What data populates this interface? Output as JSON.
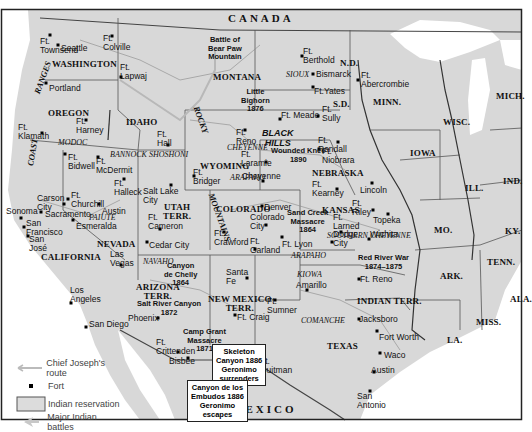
{
  "map": {
    "background_land": "#d9d9d9",
    "water": "#ffffff",
    "border_color": "#333333",
    "countries": {
      "north": "CANADA",
      "south": "MEXICO"
    },
    "states": [
      {
        "id": "washington",
        "label": "WASHINGTON",
        "x": 52,
        "y": 60
      },
      {
        "id": "oregon",
        "label": "OREGON",
        "x": 48,
        "y": 109
      },
      {
        "id": "idaho",
        "label": "IDAHO",
        "x": 126,
        "y": 118
      },
      {
        "id": "montana",
        "label": "MONTANA",
        "x": 213,
        "y": 73
      },
      {
        "id": "wyoming",
        "label": "WYOMING",
        "x": 200,
        "y": 162
      },
      {
        "id": "nd",
        "label": "N.D.",
        "x": 340,
        "y": 59
      },
      {
        "id": "sd",
        "label": "S.D.",
        "x": 333,
        "y": 100
      },
      {
        "id": "nebraska",
        "label": "NEBRASKA",
        "x": 312,
        "y": 169
      },
      {
        "id": "kansas",
        "label": "KANSAS",
        "x": 322,
        "y": 206
      },
      {
        "id": "colorado",
        "label": "COLORADO",
        "x": 216,
        "y": 205
      },
      {
        "id": "utah",
        "label": "UTAH\nTERR.",
        "x": 163,
        "y": 203
      },
      {
        "id": "nevada",
        "label": "NEVADA",
        "x": 97,
        "y": 240
      },
      {
        "id": "california",
        "label": "CALIFORNIA",
        "x": 41,
        "y": 253
      },
      {
        "id": "arizona",
        "label": "ARIZONA\nTERR.",
        "x": 136,
        "y": 283
      },
      {
        "id": "new-mexico",
        "label": "NEW MEXICO\nTERR.",
        "x": 208,
        "y": 295
      },
      {
        "id": "texas",
        "label": "TEXAS",
        "x": 327,
        "y": 342
      },
      {
        "id": "indian-terr",
        "label": "INDIAN TERR.",
        "x": 357,
        "y": 297
      },
      {
        "id": "minn",
        "label": "MINN.",
        "x": 373,
        "y": 98
      },
      {
        "id": "wisc",
        "label": "WISC.",
        "x": 443,
        "y": 118
      },
      {
        "id": "mich",
        "label": "MICH.",
        "x": 496,
        "y": 92
      },
      {
        "id": "iowa",
        "label": "IOWA",
        "x": 410,
        "y": 149
      },
      {
        "id": "ill",
        "label": "ILL.",
        "x": 465,
        "y": 184
      },
      {
        "id": "ind",
        "label": "IND.",
        "x": 503,
        "y": 177
      },
      {
        "id": "mo",
        "label": "MO.",
        "x": 434,
        "y": 226
      },
      {
        "id": "ky",
        "label": "KY.",
        "x": 505,
        "y": 227
      },
      {
        "id": "tenn",
        "label": "TENN.",
        "x": 487,
        "y": 258
      },
      {
        "id": "ark",
        "label": "ARK.",
        "x": 440,
        "y": 272
      },
      {
        "id": "miss",
        "label": "MISS.",
        "x": 476,
        "y": 318
      },
      {
        "id": "ala",
        "label": "ALA.",
        "x": 510,
        "y": 295
      },
      {
        "id": "la",
        "label": "LA.",
        "x": 447,
        "y": 336
      }
    ],
    "tribes": [
      {
        "label": "MODOC",
        "x": 58,
        "y": 138
      },
      {
        "label": "BANNOCK",
        "x": 110,
        "y": 150
      },
      {
        "label": "SHOSHONI",
        "x": 149,
        "y": 150
      },
      {
        "label": "SIOUX",
        "x": 286,
        "y": 70
      },
      {
        "label": "CHEYENNE",
        "x": 227,
        "y": 143
      },
      {
        "label": "ARAPAHO",
        "x": 230,
        "y": 173
      },
      {
        "label": "PAIUTE",
        "x": 89,
        "y": 213
      },
      {
        "label": "NAVAHO",
        "x": 143,
        "y": 257
      },
      {
        "label": "ARAPAHO",
        "x": 291,
        "y": 251
      },
      {
        "label": "SOUTHERN CHEYENNE",
        "x": 327,
        "y": 231
      },
      {
        "label": "KIOWA",
        "x": 297,
        "y": 270
      },
      {
        "label": "COMANCHE",
        "x": 301,
        "y": 316
      }
    ],
    "ranges": [
      {
        "label": "COAST",
        "x": 26,
        "y": 165,
        "rotate": -80
      },
      {
        "label": "RANGES",
        "x": 33,
        "y": 92,
        "rotate": -70
      },
      {
        "label": "ROCKY",
        "x": 200,
        "y": 105,
        "rotate": 70
      },
      {
        "label": "MOUNTAINS",
        "x": 215,
        "y": 192,
        "rotate": 70
      }
    ],
    "places": [
      {
        "label": "Ft.\nTownsend",
        "x": 40,
        "y": 37,
        "dot": [
          50,
          35
        ]
      },
      {
        "label": "Seattle",
        "x": 61,
        "y": 44,
        "dot": [
          58,
          45
        ]
      },
      {
        "label": "Ft.\nColville",
        "x": 103,
        "y": 34,
        "dot": [
          112,
          36
        ]
      },
      {
        "label": "Ft.\nLapwaj",
        "x": 120,
        "y": 63,
        "dot": [
          121,
          77
        ]
      },
      {
        "label": "Portland",
        "x": 49,
        "y": 84,
        "dot": [
          46,
          83
        ]
      },
      {
        "label": "Ft.\nKlamath",
        "x": 18,
        "y": 123,
        "dot": [
          42,
          133
        ]
      },
      {
        "label": "Ft.\nHarney",
        "x": 76,
        "y": 117,
        "dot": [
          86,
          120
        ]
      },
      {
        "label": "Ft.\nHall",
        "x": 157,
        "y": 130,
        "dot": [
          168,
          145
        ]
      },
      {
        "label": "Ft.\nBidwell",
        "x": 68,
        "y": 153,
        "dot": [
          65,
          154
        ]
      },
      {
        "label": "Ft.\nMcDermit",
        "x": 96,
        "y": 157,
        "dot": [
          98,
          157
        ]
      },
      {
        "label": "Ft.\nHalleck",
        "x": 114,
        "y": 179,
        "dot": [
          124,
          179
        ]
      },
      {
        "label": "Salt Lake\nCity",
        "x": 143,
        "y": 187,
        "dot": [
          171,
          185
        ]
      },
      {
        "label": "Carson\nCity",
        "x": 37,
        "y": 194,
        "dot": [
          64,
          204
        ]
      },
      {
        "label": "Ft.\nChurchill",
        "x": 71,
        "y": 191,
        "dot": [
          68,
          199
        ]
      },
      {
        "label": "Austin",
        "x": 102,
        "y": 207,
        "dot": [
          99,
          204
        ]
      },
      {
        "label": "Sonoma",
        "x": 6,
        "y": 207,
        "dot": [
          21,
          218
        ]
      },
      {
        "label": "Sacramento",
        "x": 45,
        "y": 210,
        "dot": [
          41,
          212
        ]
      },
      {
        "label": "Esmeralda",
        "x": 76,
        "y": 222,
        "dot": [
          73,
          220
        ]
      },
      {
        "label": "San\nFrancisco",
        "x": 26,
        "y": 219,
        "dot": [
          24,
          227
        ]
      },
      {
        "label": "San\nJosé",
        "x": 29,
        "y": 235,
        "dot": [
          28,
          236
        ]
      },
      {
        "label": "Ft.\nCameron",
        "x": 148,
        "y": 213,
        "dot": [
          160,
          229
        ]
      },
      {
        "label": "Cedar City",
        "x": 149,
        "y": 241,
        "dot": [
          147,
          242
        ]
      },
      {
        "label": "Las\nVegas",
        "x": 110,
        "y": 250,
        "dot": [
          121,
          265
        ]
      },
      {
        "label": "Los\nAngeles",
        "x": 70,
        "y": 286,
        "dot": [
          71,
          303
        ]
      },
      {
        "label": "San Diego",
        "x": 89,
        "y": 320,
        "dot": [
          86,
          327
        ]
      },
      {
        "label": "Phoenix",
        "x": 128,
        "y": 314,
        "dot": [
          158,
          318
        ]
      },
      {
        "label": "Ft.\nCrittenden",
        "x": 156,
        "y": 338,
        "dot": [
          178,
          352
        ]
      },
      {
        "label": "Bisbee",
        "x": 169,
        "y": 357,
        "dot": [
          188,
          358
        ]
      },
      {
        "label": "Ft.\nBerthold",
        "x": 303,
        "y": 47,
        "dot": [
          302,
          56
        ]
      },
      {
        "label": "Bismarck",
        "x": 316,
        "y": 70,
        "dot": [
          313,
          74
        ]
      },
      {
        "label": "Ft.Yates",
        "x": 314,
        "y": 87,
        "dot": [
          313,
          87
        ]
      },
      {
        "label": "Ft.\nAbercrombie",
        "x": 361,
        "y": 71,
        "dot": [
          358,
          80
        ]
      },
      {
        "label": "Ft. Meade",
        "x": 281,
        "y": 111,
        "dot": [
          280,
          119
        ]
      },
      {
        "label": "Ft.\nSully",
        "x": 322,
        "y": 105,
        "dot": [
          318,
          116
        ]
      },
      {
        "label": "Ft.\nRandall",
        "x": 318,
        "y": 136,
        "dot": [
          338,
          142
        ]
      },
      {
        "label": "Ft.\nReno",
        "x": 236,
        "y": 128,
        "dot": [
          245,
          130
        ]
      },
      {
        "label": "Ft.\nNiobrara",
        "x": 322,
        "y": 147,
        "dot": [
          319,
          149
        ]
      },
      {
        "label": "Ft.\nLaramie",
        "x": 241,
        "y": 150,
        "dot": [
          266,
          162
        ]
      },
      {
        "label": "Cheyenne",
        "x": 242,
        "y": 172,
        "dot": [
          263,
          181
        ]
      },
      {
        "label": "Ft.\nBridger",
        "x": 193,
        "y": 168,
        "dot": [
          194,
          176
        ]
      },
      {
        "label": "Ft.\nKearney",
        "x": 312,
        "y": 180,
        "dot": [
          337,
          189
        ]
      },
      {
        "label": "Lincoln",
        "x": 360,
        "y": 186,
        "dot": [
          372,
          183
        ]
      },
      {
        "label": "Ft.\nRiley",
        "x": 352,
        "y": 199,
        "dot": [
          373,
          210
        ]
      },
      {
        "label": "Topeka",
        "x": 373,
        "y": 216,
        "dot": [
          388,
          214
        ]
      },
      {
        "label": "Denver",
        "x": 264,
        "y": 203,
        "dot": [
          262,
          206
        ]
      },
      {
        "label": "Colorado\nCity",
        "x": 250,
        "y": 213,
        "dot": [
          266,
          225
        ]
      },
      {
        "label": "Ft.\nCrawford",
        "x": 214,
        "y": 229,
        "dot": [
          224,
          232
        ]
      },
      {
        "label": "Ft.\nGarland",
        "x": 250,
        "y": 237,
        "dot": [
          255,
          249
        ]
      },
      {
        "label": "Ft. Lyon",
        "x": 282,
        "y": 240,
        "dot": [
          282,
          237
        ]
      },
      {
        "label": "Dodge\nCity",
        "x": 333,
        "y": 230,
        "dot": [
          332,
          242
        ]
      },
      {
        "label": "Ft.\nLarned",
        "x": 333,
        "y": 213,
        "dot": [
          341,
          232
        ]
      },
      {
        "label": "Wichita",
        "x": 370,
        "y": 230,
        "dot": [
          369,
          239
        ]
      },
      {
        "label": "Santa\nFe",
        "x": 226,
        "y": 268,
        "dot": [
          247,
          278
        ]
      },
      {
        "label": "Ft.\nSumner",
        "x": 267,
        "y": 297,
        "dot": [
          275,
          300
        ]
      },
      {
        "label": "Ft. Craig",
        "x": 237,
        "y": 313,
        "dot": [
          235,
          315
        ]
      },
      {
        "label": "Amarillo",
        "x": 296,
        "y": 281,
        "dot": [
          307,
          290
        ]
      },
      {
        "label": "Ft. Reno",
        "x": 360,
        "y": 275,
        "dot": [
          359,
          279
        ]
      },
      {
        "label": "Ft.\nQuitman",
        "x": 260,
        "y": 357,
        "dot": [
          257,
          366
        ]
      },
      {
        "label": "Jacksboro",
        "x": 359,
        "y": 315,
        "dot": [
          359,
          319
        ]
      },
      {
        "label": "Fort Worth",
        "x": 379,
        "y": 333,
        "dot": [
          377,
          331
        ]
      },
      {
        "label": "Waco",
        "x": 384,
        "y": 351,
        "dot": [
          380,
          353
        ]
      },
      {
        "label": "Austin",
        "x": 371,
        "y": 366,
        "dot": [
          374,
          372
        ]
      },
      {
        "label": "San\nAntonio",
        "x": 357,
        "y": 392,
        "dot": [
          370,
          391
        ]
      }
    ],
    "battles": [
      {
        "label": "Battle of\nBear Paw\nMountain",
        "x": 208,
        "y": 36
      },
      {
        "label": "Little\nBighorn\n1876",
        "x": 241,
        "y": 88
      },
      {
        "label": "Wounded Knee\n1890",
        "x": 271,
        "y": 147
      },
      {
        "label": "Sand Creek\nMassacre\n1864",
        "x": 287,
        "y": 209
      },
      {
        "label": "Red River War\n1874–1875",
        "x": 358,
        "y": 254
      },
      {
        "label": "Canyon\nde Chelly\n1864",
        "x": 164,
        "y": 262
      },
      {
        "label": "Salt River Canyon\n1872",
        "x": 137,
        "y": 300
      },
      {
        "label": "Camp Grant\nMassacre\n1871",
        "x": 183,
        "y": 328
      }
    ],
    "callouts": [
      {
        "label": "Skeleton\nCanyon 1886\nGeronimo\nsurrenders",
        "x": 212,
        "y": 344
      },
      {
        "label": "Canyon de los\nEmbudos 1886\nGeronimo\nescapes",
        "x": 187,
        "y": 380
      }
    ]
  },
  "legend": {
    "items": [
      {
        "symbol": "arrow-line",
        "label": "Chief Joseph's route"
      },
      {
        "symbol": "fort-dot",
        "label": "Fort"
      },
      {
        "symbol": "reservation-box",
        "label": "Indian reservation"
      },
      {
        "symbol": "battle-arrow",
        "label": "Major Indian battles"
      }
    ]
  }
}
